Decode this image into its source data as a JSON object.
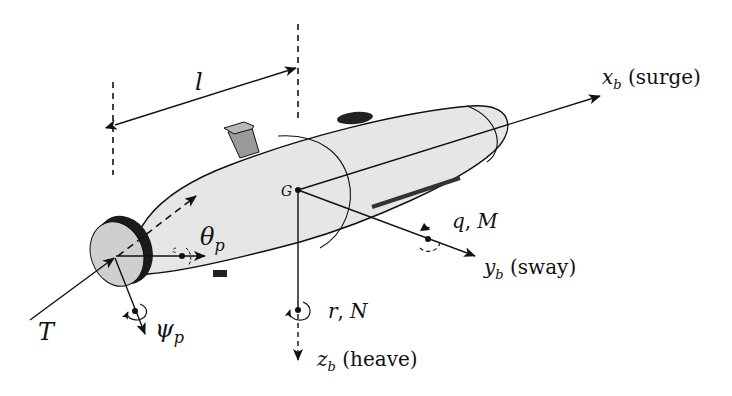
{
  "diagram": {
    "type": "auv-body-frame",
    "colors": {
      "hull_fill": "#e6e6e6",
      "stroke": "#111111",
      "fin_fill": "#9a9a9a",
      "fin_top_fill": "#b8b8b8",
      "propeller_ring": "#1a1a1a",
      "propeller_face": "#cfcfcf",
      "background": "#ffffff"
    },
    "labels": {
      "length": "l",
      "cg": "G",
      "surge_axis": "x",
      "surge_sub": "b",
      "surge_text": " (surge)",
      "sway_axis": "y",
      "sway_sub": "b",
      "sway_text": " (sway)",
      "heave_axis": "z",
      "heave_sub": "b",
      "heave_text": " (heave)",
      "pitch_rate": "q",
      "pitch_moment": "M",
      "yaw_rate": "r",
      "yaw_moment": "N",
      "thrust": "T",
      "prop_pitch": "θ",
      "prop_pitch_sub": "p",
      "prop_yaw": "ψ",
      "prop_yaw_sub": "p",
      "comma": ","
    }
  }
}
